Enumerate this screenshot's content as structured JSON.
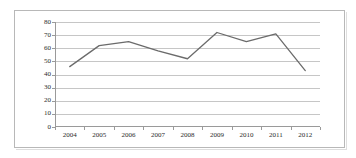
{
  "chart_data": {
    "type": "line",
    "title": "",
    "subtitle": "",
    "xlabel": "",
    "ylabel": "",
    "categories": [
      "2004",
      "2005",
      "2006",
      "2007",
      "2008",
      "2009",
      "2010",
      "2011",
      "2012"
    ],
    "values": [
      46,
      62,
      65,
      58,
      52,
      72,
      65,
      71,
      43
    ],
    "series": [
      {
        "name": "",
        "values": [
          46,
          62,
          65,
          58,
          52,
          72,
          65,
          71,
          43
        ]
      }
    ],
    "ylim": [
      0,
      80
    ],
    "ytick_values": [
      0,
      10,
      20,
      30,
      40,
      50,
      60,
      70,
      80
    ],
    "ytick_labels": [
      "0",
      "10",
      "20",
      "30",
      "40",
      "50",
      "60",
      "70",
      "80"
    ],
    "grid": true,
    "grid_axis": "y",
    "legend": false,
    "legend_position": "none",
    "markers": false,
    "line_color": "#6b6b6b",
    "grid_color": "#c6c6c6",
    "axis_color": "#9a9a9a",
    "text_color": "#2b2b2b",
    "background_color": "#ffffff",
    "border_color": "#b8b8b8",
    "annotations": []
  }
}
